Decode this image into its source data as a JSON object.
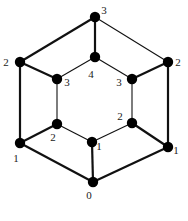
{
  "diagram": {
    "type": "graph",
    "nodes": [
      {
        "id": "top",
        "x": 95,
        "y": 17,
        "label": "3",
        "lx": 104,
        "ly": 14
      },
      {
        "id": "left-outer",
        "x": 20,
        "y": 62,
        "label": "2",
        "lx": 6,
        "ly": 66
      },
      {
        "id": "right-outer",
        "x": 168,
        "y": 62,
        "label": "2",
        "lx": 178,
        "ly": 66
      },
      {
        "id": "center",
        "x": 95,
        "y": 57,
        "label": "4",
        "lx": 91,
        "ly": 78
      },
      {
        "id": "inner-left",
        "x": 57,
        "y": 79,
        "label": "3",
        "lx": 67,
        "ly": 86
      },
      {
        "id": "inner-right",
        "x": 132,
        "y": 79,
        "label": "3",
        "lx": 119,
        "ly": 86
      },
      {
        "id": "inner-lower-left",
        "x": 57,
        "y": 124,
        "label": "2",
        "lx": 53,
        "ly": 141
      },
      {
        "id": "inner-lower-right",
        "x": 132,
        "y": 123,
        "label": "2",
        "lx": 120,
        "ly": 120
      },
      {
        "id": "center-bottom",
        "x": 92,
        "y": 142,
        "label": "1",
        "lx": 99,
        "ly": 150
      },
      {
        "id": "left-lower",
        "x": 20,
        "y": 143,
        "label": "1",
        "lx": 16,
        "ly": 162
      },
      {
        "id": "right-lower",
        "x": 168,
        "y": 147,
        "label": "1",
        "lx": 176,
        "ly": 154
      },
      {
        "id": "bottom",
        "x": 93,
        "y": 182,
        "label": "0",
        "lx": 89,
        "ly": 199
      }
    ],
    "edges": [
      {
        "from": "top",
        "to": "left-outer",
        "weight": "thick"
      },
      {
        "from": "top",
        "to": "right-outer",
        "weight": "thin"
      },
      {
        "from": "top",
        "to": "center",
        "weight": "thick"
      },
      {
        "from": "left-outer",
        "to": "inner-left",
        "weight": "thick"
      },
      {
        "from": "center",
        "to": "inner-left",
        "weight": "thin"
      },
      {
        "from": "center",
        "to": "inner-right",
        "weight": "thin"
      },
      {
        "from": "inner-right",
        "to": "right-outer",
        "weight": "thick"
      },
      {
        "from": "left-outer",
        "to": "left-lower",
        "weight": "thick"
      },
      {
        "from": "right-outer",
        "to": "right-lower",
        "weight": "thick"
      },
      {
        "from": "inner-left",
        "to": "inner-lower-left",
        "weight": "thin"
      },
      {
        "from": "inner-right",
        "to": "inner-lower-right",
        "weight": "thin"
      },
      {
        "from": "inner-lower-left",
        "to": "left-lower",
        "weight": "thick"
      },
      {
        "from": "inner-lower-left",
        "to": "center-bottom",
        "weight": "thin"
      },
      {
        "from": "center-bottom",
        "to": "inner-lower-right",
        "weight": "thin"
      },
      {
        "from": "inner-lower-right",
        "to": "right-lower",
        "weight": "thick"
      },
      {
        "from": "left-lower",
        "to": "bottom",
        "weight": "thick"
      },
      {
        "from": "center-bottom",
        "to": "bottom",
        "weight": "thick"
      },
      {
        "from": "right-lower",
        "to": "bottom",
        "weight": "thick"
      }
    ],
    "colors": {
      "node": "#000000",
      "edge": "#111111",
      "label": "#222222",
      "background": "#ffffff"
    }
  }
}
